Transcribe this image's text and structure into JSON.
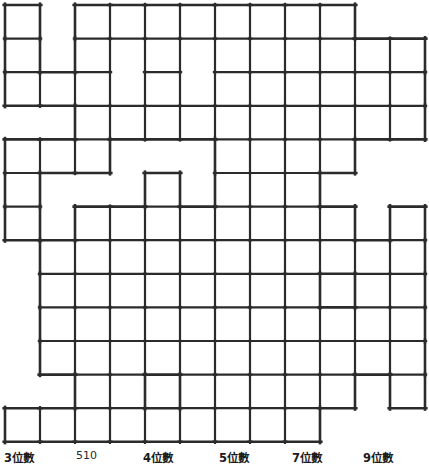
{
  "puzzle": {
    "title": "number-fit crossword grid",
    "grid": {
      "columns": 12,
      "rows": 12,
      "origin_x": 5,
      "origin_y": 5,
      "cell_width": 35,
      "cell_height": 33.6,
      "line_color": "#2b2b2b",
      "fill_color": "#ffffff",
      "outer_line_width": 2.6,
      "inner_line_width": 2.2,
      "cells": [
        [
          1,
          0,
          1,
          1,
          1,
          1,
          1,
          1,
          1,
          1,
          0,
          0
        ],
        [
          1,
          0,
          1,
          1,
          1,
          1,
          1,
          1,
          1,
          1,
          1,
          1
        ],
        [
          1,
          1,
          1,
          1,
          1,
          1,
          1,
          1,
          1,
          1,
          1,
          1
        ],
        [
          0,
          0,
          1,
          1,
          1,
          1,
          1,
          1,
          1,
          1,
          1,
          1
        ],
        [
          1,
          1,
          1,
          0,
          0,
          0,
          1,
          1,
          1,
          1,
          0,
          0
        ],
        [
          1,
          0,
          0,
          0,
          1,
          0,
          1,
          1,
          1,
          0,
          0,
          0
        ],
        [
          1,
          0,
          1,
          1,
          1,
          1,
          1,
          1,
          1,
          1,
          0,
          1
        ],
        [
          0,
          1,
          1,
          1,
          1,
          1,
          1,
          1,
          1,
          1,
          1,
          1
        ],
        [
          0,
          1,
          1,
          1,
          1,
          1,
          1,
          1,
          1,
          0,
          1,
          1
        ],
        [
          0,
          1,
          1,
          1,
          1,
          1,
          1,
          1,
          1,
          1,
          1,
          1
        ],
        [
          0,
          1,
          1,
          1,
          1,
          1,
          1,
          1,
          1,
          1,
          1,
          1
        ],
        [
          0,
          0,
          1,
          1,
          0,
          1,
          1,
          1,
          1,
          1,
          0,
          1
        ],
        [
          1,
          1,
          1,
          1,
          1,
          1,
          1,
          1,
          1,
          0,
          0,
          0
        ]
      ],
      "merged_blocks": [
        {
          "row": 1,
          "col": 3,
          "row_span": 2,
          "col_span": 1
        },
        {
          "row": 1,
          "col": 5,
          "row_span": 2,
          "col_span": 1
        },
        {
          "row": 2,
          "col": 3,
          "row_span": 1,
          "col_span": 1
        }
      ]
    }
  },
  "legend": {
    "items": [
      {
        "label": "3位數",
        "x": 4,
        "y": 3,
        "style": "bold"
      },
      {
        "label": "510",
        "x": 76,
        "y": 3,
        "style": "plain"
      },
      {
        "label": "4位數",
        "x": 143,
        "y": 3,
        "style": "bold"
      },
      {
        "label": "5位數",
        "x": 219,
        "y": 3,
        "style": "bold"
      },
      {
        "label": "7位數",
        "x": 292,
        "y": 3,
        "style": "bold"
      },
      {
        "label": "9位數",
        "x": 363,
        "y": 3,
        "style": "bold"
      }
    ]
  }
}
